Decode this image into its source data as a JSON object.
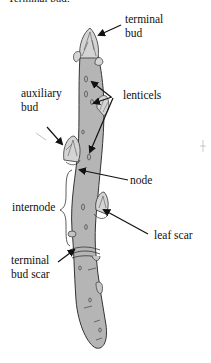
{
  "diagram": {
    "title": "Terminal bud:",
    "labels": {
      "terminal_bud": "terminal\nbud",
      "lenticels": "lenticels",
      "auxiliary_bud": "auxiliary\nbud",
      "node": "node",
      "internode": "internode",
      "leaf_scar": "leaf scar",
      "terminal_bud_scar": "terminal\nbud scar"
    },
    "colors": {
      "twig_fill": "#b5b5b5",
      "bud_fill": "#d4d4d4",
      "outline": "#333333",
      "arrow": "#111111"
    }
  }
}
